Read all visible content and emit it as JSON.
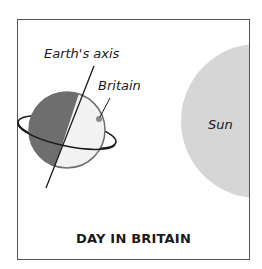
{
  "diagram": {
    "title": "DAY IN BRITAIN",
    "labels": {
      "earths_axis": "Earth's axis",
      "britain": "Britain",
      "sun": "Sun"
    },
    "colors": {
      "night_side": "#6e6e6e",
      "day_side": "#f2f2f2",
      "sun": "#d6d6d6",
      "britain_dot": "#8a8a8a",
      "lines": "#1a1a1a",
      "frame": "#555555"
    }
  }
}
